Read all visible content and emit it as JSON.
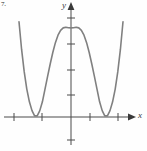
{
  "figure": {
    "number_label": "7.",
    "background_color": "#fefefe"
  },
  "axes": {
    "x_label": "x",
    "y_label": "y",
    "axis_color": "#4a4a4a",
    "origin_px": {
      "x": 71,
      "y": 117
    },
    "x_axis_y_px": 117,
    "y_axis_x_px": 71,
    "x_arrow_tip_px": 136,
    "y_arrow_tip_px": 2,
    "x_tick_positions_px": [
      14,
      42,
      90,
      118
    ],
    "y_tick_positions_px": [
      18,
      44,
      70,
      95,
      140
    ],
    "tick_half_length_px": 4
  },
  "chart_data": {
    "type": "line",
    "title": "",
    "xlabel": "x",
    "ylabel": "y",
    "grid": false,
    "legend": null,
    "curve_color": "#808080",
    "curve_width_px": 1.6,
    "xlim": [
      -2.55,
      2.55
    ],
    "ylim": [
      -1.0,
      4.6
    ],
    "x_tick_values": [
      -2,
      -1,
      1,
      2
    ],
    "y_tick_values": [
      1,
      2,
      3,
      4,
      -1
    ],
    "roots": [
      -1.4,
      1.4
    ],
    "local_maximum": {
      "x": 0,
      "y": 4.05
    },
    "local_minima": [
      {
        "x": -1.4,
        "y": 0
      },
      {
        "x": 1.4,
        "y": 0
      }
    ],
    "x": [
      -2.2,
      -2.1,
      -2.0,
      -1.9,
      -1.8,
      -1.7,
      -1.6,
      -1.5,
      -1.4,
      -1.3,
      -1.2,
      -1.1,
      -1.0,
      -0.9,
      -0.8,
      -0.7,
      -0.6,
      -0.5,
      -0.4,
      -0.3,
      -0.2,
      -0.1,
      0.0,
      0.1,
      0.2,
      0.3,
      0.4,
      0.5,
      0.6,
      0.7,
      0.8,
      0.9,
      1.0,
      1.1,
      1.2,
      1.3,
      1.4,
      1.5,
      1.6,
      1.7,
      1.8,
      1.9,
      2.0,
      2.1,
      2.2
    ],
    "y": [
      7.64,
      5.85,
      4.33,
      3.07,
      2.06,
      1.27,
      0.69,
      0.29,
      0.05,
      0.05,
      0.29,
      0.69,
      1.27,
      1.85,
      2.41,
      2.93,
      3.38,
      3.72,
      3.94,
      4.05,
      4.08,
      4.06,
      4.05,
      4.06,
      4.08,
      4.05,
      3.94,
      3.72,
      3.38,
      2.93,
      2.41,
      1.85,
      1.27,
      0.69,
      0.29,
      0.05,
      0.05,
      0.29,
      0.69,
      1.27,
      2.06,
      3.07,
      4.33,
      5.85,
      7.64
    ],
    "equation_form": "y = a(x^2 - c)^2 + k"
  }
}
